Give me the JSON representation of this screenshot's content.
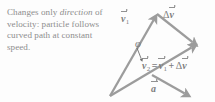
{
  "figure": {
    "name": "velocity-direction-change-vector-diagram",
    "background_color": "#fdfdfd",
    "caption": {
      "part1": "Changes only ",
      "emphasis": "direction",
      "part2": " of velocity: particle follows curved path at constant speed.",
      "color": "#8d8d8d"
    },
    "labels": {
      "v1": {
        "symbol": "v",
        "subscript": "1"
      },
      "delta_v": {
        "delta": "Δ",
        "symbol": "v"
      },
      "phi": "φ",
      "equation": {
        "lhs_symbol": "v",
        "lhs_subscript": "2",
        "equals": "=",
        "rhs1_symbol": "v",
        "rhs1_subscript": "1",
        "plus": "+",
        "rhs2_delta": "Δ",
        "rhs2_symbol": "v"
      },
      "acceleration": {
        "symbol": "a"
      }
    },
    "colors": {
      "vector_stroke": "#9c9c9c",
      "vector_fill": "#b4b4b4",
      "label_text": "#7d7d7d",
      "caption_text": "#8d8d8d",
      "angle_arrow": "#6f6f6f"
    },
    "vectors": [
      {
        "name": "v1",
        "from": [
          110,
          96
        ],
        "to": [
          157,
          14
        ]
      },
      {
        "name": "delta-v",
        "from": [
          157,
          14
        ],
        "to": [
          196,
          45
        ]
      },
      {
        "name": "v2",
        "from": [
          110,
          96
        ],
        "to": [
          196,
          45
        ]
      },
      {
        "name": "acceleration",
        "from": [
          152,
          75
        ],
        "to": [
          189,
          96
        ]
      }
    ],
    "angle": {
      "name": "phi",
      "at": [
        110,
        96
      ],
      "between": [
        "v1",
        "v2"
      ]
    }
  }
}
